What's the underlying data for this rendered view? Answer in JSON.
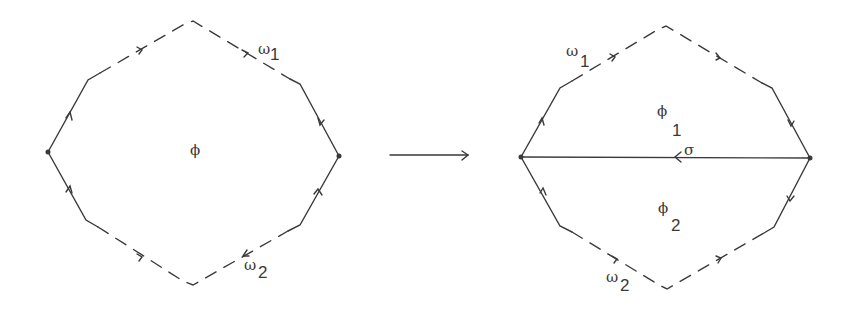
{
  "diagram": {
    "stroke_color": "#3a3a3a",
    "background": "#ffffff",
    "left_figure": {
      "region_label": "ϕ",
      "top_arc_label": "ω",
      "top_arc_sub": "1",
      "bottom_arc_label": "ω",
      "bottom_arc_sub": "2"
    },
    "transition_arrow": "→",
    "right_figure": {
      "upper_region_label": "ϕ",
      "upper_region_sub": "1",
      "lower_region_label": "ϕ",
      "lower_region_sub": "2",
      "chord_label": "σ",
      "top_arc_label": "ω",
      "top_arc_sub": "1",
      "bottom_arc_label": "ω",
      "bottom_arc_sub": "2"
    }
  }
}
